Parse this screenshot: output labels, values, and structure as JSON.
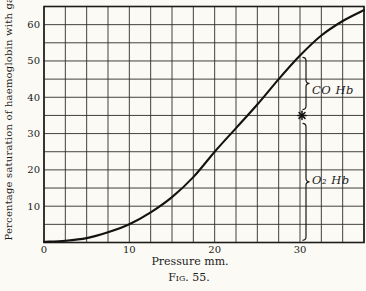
{
  "figure": {
    "caption": "Fig. 55.",
    "paper_color": "#fbfaf5",
    "ink_color": "#1b1b1b"
  },
  "chart_data": {
    "type": "line",
    "title": "",
    "xlabel": "Pressure mm.",
    "ylabel": "Percentage saturation of haemoglobin with gas",
    "xlim": [
      0,
      37.5
    ],
    "ylim": [
      0,
      65
    ],
    "xticks": [
      0,
      10,
      20,
      30
    ],
    "yticks": [
      10,
      20,
      30,
      40,
      50,
      60
    ],
    "grid_step_x": 2.5,
    "grid_step_y": 5,
    "grid": "on",
    "legend_position": "none",
    "plot_px": {
      "left": 44,
      "top": 6.5,
      "right": 364,
      "bottom": 242.5
    },
    "series": [
      {
        "name": "saturation-curve",
        "points": [
          [
            0,
            0.2
          ],
          [
            2.5,
            0.5
          ],
          [
            5,
            1.2
          ],
          [
            7.5,
            2.8
          ],
          [
            10,
            5
          ],
          [
            12.5,
            8.3
          ],
          [
            15,
            12.5
          ],
          [
            17.5,
            18
          ],
          [
            20,
            25
          ],
          [
            22.5,
            31.5
          ],
          [
            25,
            38
          ],
          [
            27.5,
            45
          ],
          [
            30,
            51.5
          ],
          [
            32.5,
            57
          ],
          [
            35,
            61
          ],
          [
            37.5,
            64
          ]
        ]
      }
    ],
    "star_point": {
      "x": 30,
      "y": 35,
      "marker": "asterisk"
    },
    "annotations": [
      {
        "label": "CO Hb",
        "x": 30,
        "from": 36.6,
        "to": 51.0,
        "label_px": {
          "x": 312,
          "y": 83
        }
      },
      {
        "label": "O₂ Hb",
        "x": 30,
        "from": 0.6,
        "to": 32.8,
        "label_px": {
          "x": 312,
          "y": 173
        }
      }
    ]
  }
}
